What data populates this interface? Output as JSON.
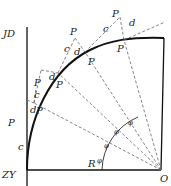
{
  "diagram": {
    "labels": {
      "JD": "JD",
      "ZY": "ZY",
      "R": "R",
      "O": "O",
      "P1": "P",
      "P2": "P",
      "P3": "P",
      "P4": "P",
      "P1p": "P",
      "P2p": "P",
      "P3p": "P",
      "P4p": "P",
      "sub1": "1",
      "sub2": "2",
      "sub3": "3",
      "sub4": "4",
      "prime": "′",
      "c": "c",
      "d": "d",
      "phi": "φ"
    },
    "colors": {
      "line": "#111111",
      "dash": "#555555",
      "text": "#222222"
    }
  }
}
